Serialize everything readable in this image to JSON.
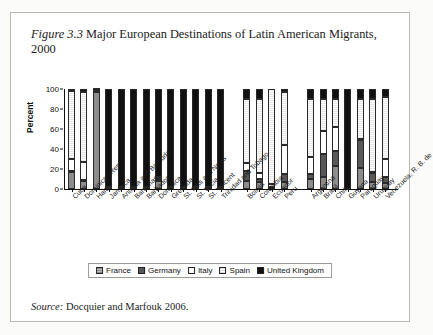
{
  "figure": {
    "label": "Figure 3.3",
    "title": "Major European Destinations of Latin American Migrants, 2000",
    "source_label": "Source:",
    "source_text": "Docquier and Marfouk 2006."
  },
  "legend": {
    "position": "bottom-center",
    "items": [
      {
        "label": "France",
        "color": "#8c8c8c"
      },
      {
        "label": "Germany",
        "color": "#585858"
      },
      {
        "label": "Italy",
        "color": "#ffffff"
      },
      {
        "label": "Spain",
        "color": "#f0f0f0"
      },
      {
        "label": "United Kingdom",
        "color": "#111111"
      }
    ]
  },
  "chart_data": {
    "type": "bar",
    "stacked": true,
    "title": "Major European Destinations of Latin American Migrants, 2000",
    "xlabel": "",
    "ylabel": "Percent",
    "ylim": [
      0,
      100
    ],
    "yticks": [
      0,
      20,
      40,
      60,
      80,
      100
    ],
    "grid": false,
    "legend_position": "bottom-center",
    "series_names": [
      "France",
      "Germany",
      "Italy",
      "Spain",
      "United Kingdom"
    ],
    "series_colors": [
      "#8c8c8c",
      "#585858",
      "#ffffff",
      "#f0f0f0",
      "#111111"
    ],
    "groups": [
      {
        "name": "Caribbean",
        "categories": [
          "Cuba",
          "Dominican Rep.",
          "Haiti",
          "Jamaica",
          "Antigua and Barbuda",
          "Bahamas",
          "Barbados",
          "Dominica",
          "Grenada",
          "St. Kitts and Nevis",
          "St. Lucia",
          "St. Vincent",
          "Trinidad and Tobago"
        ],
        "series": [
          {
            "name": "France",
            "values": [
              17,
              8,
              97,
              1,
              1,
              1,
              1,
              8,
              1,
              1,
              1,
              1,
              1
            ]
          },
          {
            "name": "Germany",
            "values": [
              1,
              1,
              1,
              1,
              1,
              1,
              1,
              2,
              1,
              1,
              1,
              1,
              1
            ]
          },
          {
            "name": "Italy",
            "values": [
              12,
              18,
              1,
              0,
              0,
              0,
              0,
              1,
              0,
              0,
              0,
              0,
              0
            ]
          },
          {
            "name": "Spain",
            "values": [
              68,
              70,
              0,
              0,
              0,
              0,
              0,
              1,
              0,
              0,
              0,
              0,
              0
            ]
          },
          {
            "name": "United Kingdom",
            "values": [
              2,
              3,
              1,
              98,
              98,
              98,
              98,
              88,
              98,
              98,
              98,
              98,
              98
            ]
          }
        ]
      },
      {
        "name": "Andean",
        "categories": [
          "Bolivia",
          "Colombia",
          "Ecuador",
          "Peru"
        ],
        "series": [
          {
            "name": "France",
            "values": [
              8,
              7,
              1,
              7
            ]
          },
          {
            "name": "Germany",
            "values": [
              10,
              3,
              1,
              8
            ]
          },
          {
            "name": "Italy",
            "values": [
              8,
              6,
              3,
              29
            ]
          },
          {
            "name": "Spain",
            "values": [
              64,
              74,
              95,
              53
            ]
          },
          {
            "name": "United Kingdom",
            "values": [
              10,
              10,
              0,
              3
            ]
          }
        ]
      },
      {
        "name": "Southern Cone",
        "categories": [
          "Argentina",
          "Brazil",
          "Chile",
          "Guyana",
          "Paraguay",
          "Uruguay",
          "Venezuela, R. B. de"
        ],
        "series": [
          {
            "name": "France",
            "values": [
              10,
              12,
              23,
              0,
              21,
              7,
              6
            ]
          },
          {
            "name": "Germany",
            "values": [
              5,
              23,
              15,
              0,
              28,
              9,
              6
            ]
          },
          {
            "name": "Italy",
            "values": [
              17,
              23,
              24,
              0,
              1,
              1,
              18
            ]
          },
          {
            "name": "Spain",
            "values": [
              58,
              32,
              28,
              0,
              40,
              73,
              62
            ]
          },
          {
            "name": "United Kingdom",
            "values": [
              10,
              10,
              10,
              100,
              10,
              10,
              8
            ]
          }
        ]
      }
    ]
  }
}
